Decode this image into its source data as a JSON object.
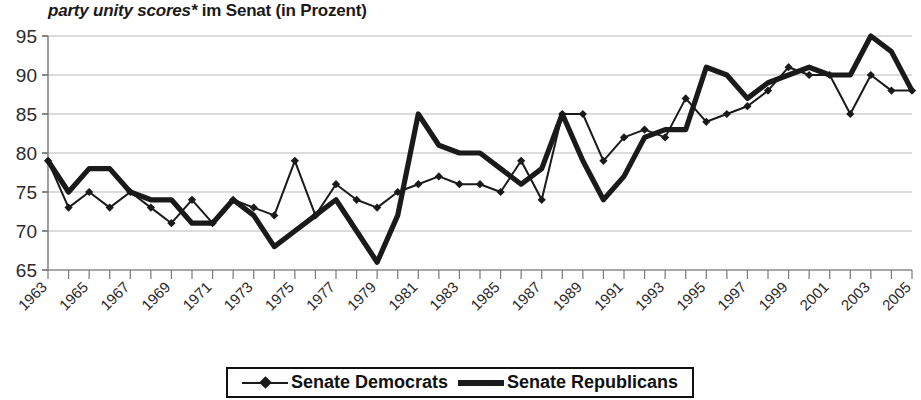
{
  "chart_data": {
    "type": "line",
    "title": "party unity scores* im Senat (in Prozent)",
    "title_italic_part": "party unity scores*",
    "title_roman_part": " im Senat (in Prozent)",
    "xlabel": "",
    "ylabel": "",
    "ylim": [
      65,
      95
    ],
    "ytick_step": 5,
    "yticks": [
      65,
      70,
      75,
      80,
      85,
      90,
      95
    ],
    "grid": true,
    "legend_position": "bottom",
    "x": [
      1963,
      1964,
      1965,
      1966,
      1967,
      1968,
      1969,
      1970,
      1971,
      1972,
      1973,
      1974,
      1975,
      1976,
      1977,
      1978,
      1979,
      1980,
      1981,
      1982,
      1983,
      1984,
      1985,
      1986,
      1987,
      1988,
      1989,
      1990,
      1991,
      1992,
      1993,
      1994,
      1995,
      1996,
      1997,
      1998,
      1999,
      2000,
      2001,
      2002,
      2003,
      2004,
      2005
    ],
    "xtick_labels": [
      "1963",
      "1965",
      "1967",
      "1969",
      "1971",
      "1973",
      "1975",
      "1977",
      "1979",
      "1981",
      "1983",
      "1985",
      "1987",
      "1989",
      "1991",
      "1993",
      "1995",
      "1997",
      "1999",
      "2001",
      "2003",
      "2005"
    ],
    "xticks": [
      1963,
      1965,
      1967,
      1969,
      1971,
      1973,
      1975,
      1977,
      1979,
      1981,
      1983,
      1985,
      1987,
      1989,
      1991,
      1993,
      1995,
      1997,
      1999,
      2001,
      2003,
      2005
    ],
    "series": [
      {
        "name": "Senate Democrats",
        "style": "thin-with-diamond-markers",
        "color": "#1a1a1a",
        "values": [
          79,
          73,
          75,
          73,
          75,
          73,
          71,
          74,
          71,
          74,
          73,
          72,
          79,
          72,
          76,
          74,
          73,
          75,
          76,
          77,
          76,
          76,
          75,
          79,
          74,
          85,
          85,
          79,
          82,
          83,
          82,
          87,
          84,
          85,
          86,
          88,
          91,
          90,
          90,
          85,
          90,
          88,
          88
        ]
      },
      {
        "name": "Senate Republicans",
        "style": "thick-line",
        "color": "#1a1a1a",
        "values": [
          79,
          75,
          78,
          78,
          75,
          74,
          74,
          71,
          71,
          74,
          72,
          68,
          70,
          72,
          74,
          70,
          66,
          72,
          85,
          81,
          80,
          80,
          78,
          76,
          78,
          85,
          79,
          74,
          77,
          82,
          83,
          83,
          91,
          90,
          87,
          89,
          90,
          91,
          90,
          90,
          95,
          93,
          88
        ]
      }
    ]
  },
  "legend": {
    "entries": [
      {
        "label": "Senate Democrats",
        "swatch": "thin-diamond-line-swatch"
      },
      {
        "label": "Senate Republicans",
        "swatch": "thick-line-swatch"
      }
    ]
  }
}
